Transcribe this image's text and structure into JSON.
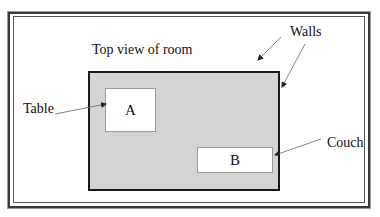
{
  "diagram": {
    "title": "Top view of room",
    "labels": {
      "walls": "Walls",
      "table": "Table",
      "couch": "Couch"
    },
    "objects": {
      "table": {
        "letter": "A"
      },
      "couch": {
        "letter": "B"
      }
    },
    "colors": {
      "room_fill": "#d4d4d4",
      "room_border": "#1a1a1a",
      "furniture_fill": "#ffffff",
      "frame": "#3a3a3a",
      "arrow": "#666666"
    }
  }
}
